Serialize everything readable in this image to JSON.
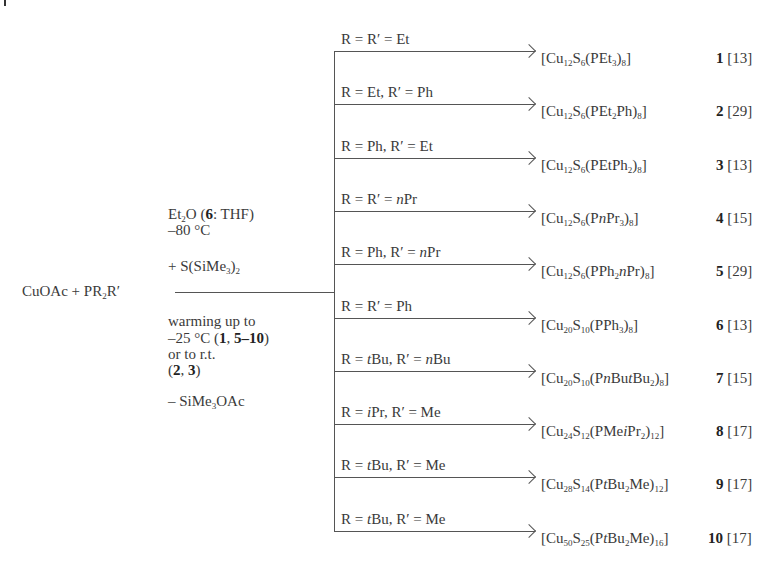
{
  "reactants": {
    "left": "CuOAc + PR",
    "sub": "2",
    "right": "R′"
  },
  "conditions_above": {
    "line1_a": "Et",
    "line1_sub": "2",
    "line1_b": "O (",
    "line1_bold": "6",
    "line1_c": ": THF)",
    "line2": "–80 °C",
    "line3_a": "+ S(SiMe",
    "line3_sub1": "3",
    "line3_b": ")",
    "line3_sub2": "2"
  },
  "conditions_below": {
    "line1": "warming up to",
    "line2_a": "–25 °C (",
    "line2_bold1": "1",
    "line2_b": ", ",
    "line2_bold2": "5–10",
    "line2_c": ")",
    "line3": "or to r.t.",
    "line4_a": "(",
    "line4_bold1": "2",
    "line4_b": ", ",
    "line4_bold2": "3",
    "line4_c": ")",
    "line5_a": "– SiMe",
    "line5_sub": "3",
    "line5_b": "OAc"
  },
  "branches": [
    {
      "label": "R = R′ = Et",
      "product_html": "[Cu<sub>12</sub>S<sub>6</sub>(PEt<sub>3</sub>)<sub>8</sub>]",
      "compound": "1",
      "ref": "[13]"
    },
    {
      "label": "R = Et, R′ = Ph",
      "product_html": "[Cu<sub>12</sub>S<sub>6</sub>(PEt<sub>2</sub>Ph)<sub>8</sub>]",
      "compound": "2",
      "ref": "[29]"
    },
    {
      "label": "R = Ph, R′ = Et",
      "product_html": "[Cu<sub>12</sub>S<sub>6</sub>(PEtPh<sub>2</sub>)<sub>8</sub>]",
      "compound": "3",
      "ref": "[13]"
    },
    {
      "label_html": "R = R′ = <i>n</i>Pr",
      "product_html": "[Cu<sub>12</sub>S<sub>6</sub>(P<i>n</i>Pr<sub>3</sub>)<sub>8</sub>]",
      "compound": "4",
      "ref": "[15]"
    },
    {
      "label_html": "R = Ph, R′ = <i>n</i>Pr",
      "product_html": "[Cu<sub>12</sub>S<sub>6</sub>(PPh<sub>2</sub><i>n</i>Pr)<sub>8</sub>]",
      "compound": "5",
      "ref": "[29]"
    },
    {
      "label": "R = R′ = Ph",
      "product_html": "[Cu<sub>20</sub>S<sub>10</sub>(PPh<sub>3</sub>)<sub>8</sub>]",
      "compound": "6",
      "ref": "[13]"
    },
    {
      "label_html": "R = <i>t</i>Bu, R′ = <i>n</i>Bu",
      "product_html": "[Cu<sub>20</sub>S<sub>10</sub>(P<i>n</i>Bu<i>t</i>Bu<sub>2</sub>)<sub>8</sub>]",
      "compound": "7",
      "ref": "[15]"
    },
    {
      "label_html": "R = <i>i</i>Pr, R′ = Me",
      "product_html": "[Cu<sub>24</sub>S<sub>12</sub>(PMe<i>i</i>Pr<sub>2</sub>)<sub>12</sub>]",
      "compound": "8",
      "ref": "[17]"
    },
    {
      "label_html": "R = <i>t</i>Bu, R′ = Me",
      "product_html": "[Cu<sub>28</sub>S<sub>14</sub>(P<i>t</i>Bu<sub>2</sub>Me)<sub>12</sub>]",
      "compound": "9",
      "ref": "[17]"
    },
    {
      "label_html": "R = <i>t</i>Bu, R′ = Me",
      "product_html": "[Cu<sub>50</sub>S<sub>25</sub>(P<i>t</i>Bu<sub>2</sub>Me)<sub>16</sub>]",
      "compound": "10",
      "ref": "[17]"
    }
  ],
  "colors": {
    "line": "#555555",
    "text": "#3a3a3a"
  }
}
